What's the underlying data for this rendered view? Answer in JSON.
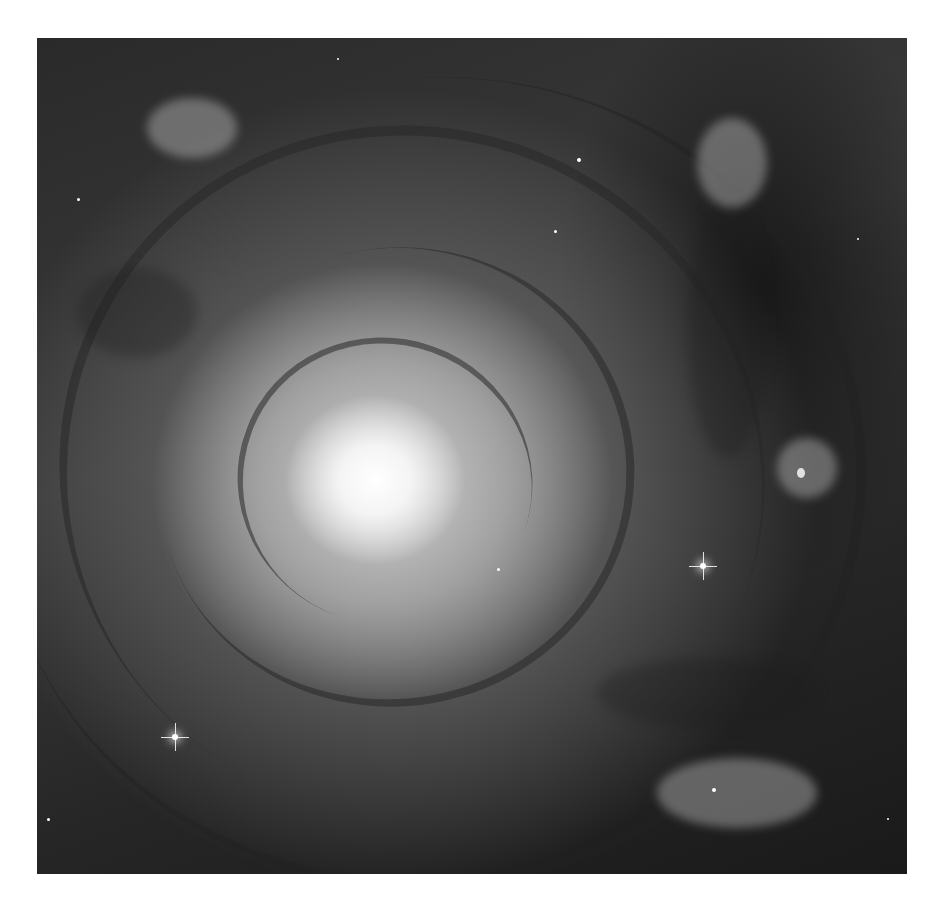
{
  "image": {
    "subject": "spiral-galaxy",
    "description": "Grayscale face-on spiral galaxy with bright central core, dark dust lanes and star-forming clusters along spiral arms, surrounded by field stars",
    "palette": {
      "border": "#ffffff",
      "core": "#ffffff",
      "arms": "#a0a0a0",
      "background_space": "#262626"
    },
    "bright_stars": [
      {
        "x": 703,
        "y": 566
      },
      {
        "x": 175,
        "y": 737
      }
    ]
  }
}
